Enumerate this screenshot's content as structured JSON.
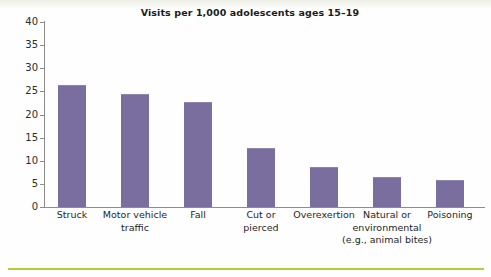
{
  "chart_data": {
    "type": "bar",
    "title": "Visits per 1,000 adolescents ages 15–19",
    "xlabel": "",
    "ylabel": "",
    "ylim": [
      0,
      40
    ],
    "yticks": [
      0,
      5,
      10,
      15,
      20,
      25,
      30,
      35,
      40
    ],
    "grid": false,
    "legend": false,
    "bar_color": "#7a6e9e",
    "categories": [
      "Struck",
      "Motor vehicle traffic",
      "Fall",
      "Cut or pierced",
      "Overexertion",
      "Natural or environmental (e.g., animal bites)",
      "Poisoning"
    ],
    "category_labels_wrapped": [
      "Struck",
      "Motor vehicle\ntraffic",
      "Fall",
      "Cut or\npierced",
      "Overexertion",
      "Natural or\nenvironmental\n(e.g., animal bites)",
      "Poisoning"
    ],
    "values": [
      26.1,
      24.3,
      22.4,
      12.6,
      8.4,
      6.2,
      5.7
    ]
  },
  "decor": {
    "bottom_rule_color": "#b5cc3c"
  }
}
